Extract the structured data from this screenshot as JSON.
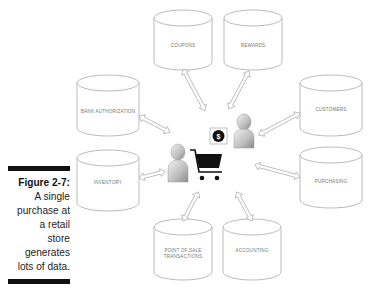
{
  "figure": {
    "label": "Figure 2-7:",
    "caption_lines": [
      "A single",
      "purchase at",
      "a retail store",
      "generates",
      "lots of data."
    ]
  },
  "databases": [
    {
      "id": "coupons",
      "label": "COUPONS"
    },
    {
      "id": "rewards",
      "label": "REWARDS"
    },
    {
      "id": "bank-authorization",
      "label": "BANK AUTHORIZATION"
    },
    {
      "id": "customers",
      "label": "CUSTOMERS"
    },
    {
      "id": "inventory",
      "label": "INVENTORY"
    },
    {
      "id": "purchasing",
      "label": "PURCHASING"
    },
    {
      "id": "point-of-sale",
      "label_lines": [
        "POINT OF SALE",
        "TRANSACTIONS"
      ]
    },
    {
      "id": "accounting",
      "label": "ACCOUNTING"
    }
  ],
  "center": {
    "shopper": "person",
    "cashier": "person",
    "cart": "shopping-cart",
    "money": "$"
  }
}
